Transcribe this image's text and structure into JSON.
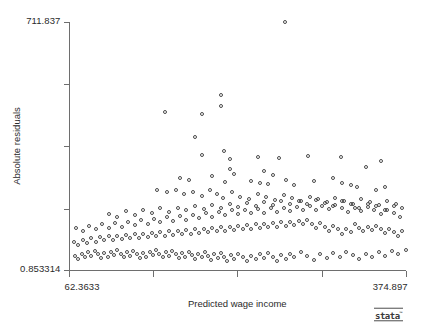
{
  "chart_data": {
    "type": "scatter",
    "title": "",
    "xlabel": "Predicted wage income",
    "ylabel": "Absolute residuals",
    "xlim": [
      62.3633,
      374.897
    ],
    "ylim": [
      0.853314,
      711.837
    ],
    "xticklabels": [
      "62.3633",
      "",
      "",
      "",
      "374.897"
    ],
    "yticklabels": [
      "711.837",
      "",
      "",
      "",
      "0.853314"
    ],
    "xtickvalues": [
      62.3633,
      140.497,
      218.63,
      296.764,
      374.897
    ],
    "ytickvalues": [
      711.837,
      533.591,
      355.345,
      177.099,
      0.853314
    ],
    "grid": false,
    "legend": null,
    "marker": "open-circle",
    "marker_color": "#4a4a4a",
    "annotations": [
      "Stata logo bottom-right"
    ],
    "points": [
      [
        263.0,
        711.8
      ],
      [
        152.0,
        452.0
      ],
      [
        186.0,
        446.0
      ],
      [
        204.0,
        500.0
      ],
      [
        204.0,
        470.0
      ],
      [
        180.0,
        380.0
      ],
      [
        207.0,
        340.0
      ],
      [
        186.0,
        330.0
      ],
      [
        212.0,
        318.0
      ],
      [
        238.0,
        324.0
      ],
      [
        258.0,
        320.0
      ],
      [
        285.0,
        325.0
      ],
      [
        315.0,
        322.0
      ],
      [
        338.0,
        296.0
      ],
      [
        352.0,
        312.0
      ],
      [
        212.0,
        290.0
      ],
      [
        216.0,
        276.0
      ],
      [
        244.0,
        282.0
      ],
      [
        252.0,
        272.0
      ],
      [
        196.0,
        268.0
      ],
      [
        166.0,
        262.0
      ],
      [
        174.0,
        258.0
      ],
      [
        208.0,
        252.0
      ],
      [
        232.0,
        256.0
      ],
      [
        240.0,
        250.0
      ],
      [
        248.0,
        246.0
      ],
      [
        264.0,
        258.0
      ],
      [
        272.0,
        244.0
      ],
      [
        290.0,
        254.0
      ],
      [
        308.0,
        262.0
      ],
      [
        316.0,
        248.0
      ],
      [
        324.0,
        242.0
      ],
      [
        330.0,
        236.0
      ],
      [
        348.0,
        230.0
      ],
      [
        356.0,
        238.0
      ],
      [
        145.0,
        228.0
      ],
      [
        154.0,
        222.0
      ],
      [
        162.0,
        230.0
      ],
      [
        170.0,
        216.0
      ],
      [
        178.0,
        224.0
      ],
      [
        186.0,
        212.0
      ],
      [
        194.0,
        228.0
      ],
      [
        200.0,
        218.0
      ],
      [
        206.0,
        206.0
      ],
      [
        214.0,
        222.0
      ],
      [
        222.0,
        210.0
      ],
      [
        230.0,
        204.0
      ],
      [
        238.0,
        216.0
      ],
      [
        246.0,
        208.0
      ],
      [
        254.0,
        200.0
      ],
      [
        262.0,
        214.0
      ],
      [
        270.0,
        206.0
      ],
      [
        278.0,
        198.0
      ],
      [
        286.0,
        210.0
      ],
      [
        294.0,
        202.0
      ],
      [
        302.0,
        194.0
      ],
      [
        310.0,
        206.0
      ],
      [
        318.0,
        198.0
      ],
      [
        326.0,
        190.0
      ],
      [
        334.0,
        202.0
      ],
      [
        342.0,
        194.0
      ],
      [
        350.0,
        186.0
      ],
      [
        358.0,
        198.0
      ],
      [
        366.0,
        190.0
      ],
      [
        100.0,
        160.0
      ],
      [
        108.0,
        152.0
      ],
      [
        116.0,
        168.0
      ],
      [
        124.0,
        158.0
      ],
      [
        132.0,
        170.0
      ],
      [
        140.0,
        162.0
      ],
      [
        148.0,
        176.0
      ],
      [
        156.0,
        166.0
      ],
      [
        164.0,
        178.0
      ],
      [
        172.0,
        170.0
      ],
      [
        180.0,
        182.0
      ],
      [
        188.0,
        174.0
      ],
      [
        196.0,
        186.0
      ],
      [
        204.0,
        176.0
      ],
      [
        212.0,
        188.0
      ],
      [
        220.0,
        180.0
      ],
      [
        228.0,
        192.0
      ],
      [
        236.0,
        182.0
      ],
      [
        244.0,
        194.0
      ],
      [
        252.0,
        186.0
      ],
      [
        260.0,
        196.0
      ],
      [
        268.0,
        188.0
      ],
      [
        276.0,
        198.0
      ],
      [
        284.0,
        190.0
      ],
      [
        292.0,
        200.0
      ],
      [
        300.0,
        192.0
      ],
      [
        308.0,
        184.0
      ],
      [
        316.0,
        196.0
      ],
      [
        324.0,
        188.0
      ],
      [
        332.0,
        178.0
      ],
      [
        340.0,
        190.0
      ],
      [
        348.0,
        182.0
      ],
      [
        356.0,
        172.0
      ],
      [
        364.0,
        184.0
      ],
      [
        372.0,
        176.0
      ],
      [
        70.0,
        120.0
      ],
      [
        76.0,
        112.0
      ],
      [
        82.0,
        126.0
      ],
      [
        88.0,
        116.0
      ],
      [
        94.0,
        130.0
      ],
      [
        100.0,
        120.0
      ],
      [
        106.0,
        134.0
      ],
      [
        112.0,
        124.0
      ],
      [
        118.0,
        138.0
      ],
      [
        124.0,
        128.0
      ],
      [
        130.0,
        142.0
      ],
      [
        136.0,
        132.0
      ],
      [
        142.0,
        146.0
      ],
      [
        148.0,
        136.0
      ],
      [
        154.0,
        150.0
      ],
      [
        160.0,
        140.0
      ],
      [
        166.0,
        154.0
      ],
      [
        172.0,
        144.0
      ],
      [
        178.0,
        158.0
      ],
      [
        184.0,
        148.0
      ],
      [
        190.0,
        162.0
      ],
      [
        196.0,
        152.0
      ],
      [
        202.0,
        166.0
      ],
      [
        208.0,
        156.0
      ],
      [
        214.0,
        170.0
      ],
      [
        220.0,
        160.0
      ],
      [
        226.0,
        172.0
      ],
      [
        232.0,
        162.0
      ],
      [
        238.0,
        174.0
      ],
      [
        244.0,
        164.0
      ],
      [
        250.0,
        176.0
      ],
      [
        256.0,
        166.0
      ],
      [
        262.0,
        178.0
      ],
      [
        268.0,
        168.0
      ],
      [
        274.0,
        180.0
      ],
      [
        280.0,
        170.0
      ],
      [
        286.0,
        182.0
      ],
      [
        292.0,
        172.0
      ],
      [
        298.0,
        184.0
      ],
      [
        304.0,
        174.0
      ],
      [
        310.0,
        186.0
      ],
      [
        316.0,
        176.0
      ],
      [
        322.0,
        166.0
      ],
      [
        328.0,
        178.0
      ],
      [
        334.0,
        168.0
      ],
      [
        340.0,
        180.0
      ],
      [
        346.0,
        170.0
      ],
      [
        352.0,
        160.0
      ],
      [
        358.0,
        172.0
      ],
      [
        364.0,
        162.0
      ],
      [
        370.0,
        150.0
      ],
      [
        68.0,
        80.0
      ],
      [
        72.0,
        70.0
      ],
      [
        76.0,
        86.0
      ],
      [
        80.0,
        76.0
      ],
      [
        84.0,
        90.0
      ],
      [
        88.0,
        80.0
      ],
      [
        92.0,
        94.0
      ],
      [
        96.0,
        84.0
      ],
      [
        100.0,
        96.0
      ],
      [
        104.0,
        86.0
      ],
      [
        108.0,
        98.0
      ],
      [
        112.0,
        88.0
      ],
      [
        116.0,
        100.0
      ],
      [
        120.0,
        90.0
      ],
      [
        124.0,
        102.0
      ],
      [
        128.0,
        92.0
      ],
      [
        132.0,
        104.0
      ],
      [
        136.0,
        94.0
      ],
      [
        140.0,
        106.0
      ],
      [
        144.0,
        96.0
      ],
      [
        148.0,
        108.0
      ],
      [
        152.0,
        98.0
      ],
      [
        156.0,
        110.0
      ],
      [
        160.0,
        100.0
      ],
      [
        164.0,
        112.0
      ],
      [
        168.0,
        102.0
      ],
      [
        172.0,
        114.0
      ],
      [
        176.0,
        104.0
      ],
      [
        180.0,
        116.0
      ],
      [
        184.0,
        106.0
      ],
      [
        188.0,
        118.0
      ],
      [
        192.0,
        108.0
      ],
      [
        196.0,
        120.0
      ],
      [
        200.0,
        110.0
      ],
      [
        204.0,
        122.0
      ],
      [
        208.0,
        112.0
      ],
      [
        212.0,
        124.0
      ],
      [
        216.0,
        114.0
      ],
      [
        220.0,
        126.0
      ],
      [
        224.0,
        116.0
      ],
      [
        228.0,
        128.0
      ],
      [
        232.0,
        118.0
      ],
      [
        236.0,
        130.0
      ],
      [
        240.0,
        120.0
      ],
      [
        244.0,
        132.0
      ],
      [
        248.0,
        122.0
      ],
      [
        252.0,
        134.0
      ],
      [
        256.0,
        124.0
      ],
      [
        260.0,
        136.0
      ],
      [
        264.0,
        126.0
      ],
      [
        268.0,
        138.0
      ],
      [
        272.0,
        128.0
      ],
      [
        276.0,
        140.0
      ],
      [
        280.0,
        130.0
      ],
      [
        284.0,
        142.0
      ],
      [
        288.0,
        132.0
      ],
      [
        292.0,
        120.0
      ],
      [
        296.0,
        134.0
      ],
      [
        300.0,
        124.0
      ],
      [
        304.0,
        112.0
      ],
      [
        308.0,
        126.0
      ],
      [
        312.0,
        116.0
      ],
      [
        316.0,
        104.0
      ],
      [
        320.0,
        118.0
      ],
      [
        324.0,
        108.0
      ],
      [
        328.0,
        130.0
      ],
      [
        332.0,
        120.0
      ],
      [
        336.0,
        110.0
      ],
      [
        340.0,
        124.0
      ],
      [
        344.0,
        114.0
      ],
      [
        348.0,
        126.0
      ],
      [
        352.0,
        116.0
      ],
      [
        356.0,
        106.0
      ],
      [
        360.0,
        118.0
      ],
      [
        364.0,
        108.0
      ],
      [
        368.0,
        96.0
      ],
      [
        372.0,
        110.0
      ],
      [
        69.0,
        40.0
      ],
      [
        72.0,
        30.0
      ],
      [
        75.0,
        46.0
      ],
      [
        78.0,
        36.0
      ],
      [
        81.0,
        50.0
      ],
      [
        84.0,
        40.0
      ],
      [
        87.0,
        54.0
      ],
      [
        90.0,
        44.0
      ],
      [
        93.0,
        34.0
      ],
      [
        96.0,
        48.0
      ],
      [
        99.0,
        38.0
      ],
      [
        102.0,
        52.0
      ],
      [
        105.0,
        42.0
      ],
      [
        108.0,
        56.0
      ],
      [
        111.0,
        46.0
      ],
      [
        114.0,
        36.0
      ],
      [
        117.0,
        50.0
      ],
      [
        120.0,
        40.0
      ],
      [
        123.0,
        54.0
      ],
      [
        126.0,
        44.0
      ],
      [
        129.0,
        34.0
      ],
      [
        132.0,
        48.0
      ],
      [
        135.0,
        38.0
      ],
      [
        138.0,
        52.0
      ],
      [
        141.0,
        42.0
      ],
      [
        144.0,
        56.0
      ],
      [
        147.0,
        46.0
      ],
      [
        150.0,
        36.0
      ],
      [
        153.0,
        50.0
      ],
      [
        156.0,
        40.0
      ],
      [
        159.0,
        54.0
      ],
      [
        162.0,
        44.0
      ],
      [
        165.0,
        34.0
      ],
      [
        168.0,
        48.0
      ],
      [
        171.0,
        38.0
      ],
      [
        174.0,
        52.0
      ],
      [
        177.0,
        42.0
      ],
      [
        180.0,
        30.0
      ],
      [
        183.0,
        46.0
      ],
      [
        186.0,
        36.0
      ],
      [
        189.0,
        50.0
      ],
      [
        192.0,
        40.0
      ],
      [
        195.0,
        28.0
      ],
      [
        198.0,
        44.0
      ],
      [
        201.0,
        34.0
      ],
      [
        204.0,
        48.0
      ],
      [
        207.0,
        38.0
      ],
      [
        210.0,
        26.0
      ],
      [
        213.0,
        42.0
      ],
      [
        216.0,
        32.0
      ],
      [
        220.0,
        46.0
      ],
      [
        224.0,
        36.0
      ],
      [
        228.0,
        24.0
      ],
      [
        232.0,
        40.0
      ],
      [
        236.0,
        30.0
      ],
      [
        240.0,
        44.0
      ],
      [
        244.0,
        34.0
      ],
      [
        248.0,
        48.0
      ],
      [
        252.0,
        38.0
      ],
      [
        256.0,
        26.0
      ],
      [
        260.0,
        42.0
      ],
      [
        264.0,
        32.0
      ],
      [
        268.0,
        46.0
      ],
      [
        272.0,
        36.0
      ],
      [
        278.0,
        50.0
      ],
      [
        284.0,
        40.0
      ],
      [
        290.0,
        28.0
      ],
      [
        296.0,
        44.0
      ],
      [
        302.0,
        34.0
      ],
      [
        308.0,
        48.0
      ],
      [
        314.0,
        38.0
      ],
      [
        320.0,
        52.0
      ],
      [
        326.0,
        42.0
      ],
      [
        332.0,
        30.0
      ],
      [
        338.0,
        46.0
      ],
      [
        344.0,
        36.0
      ],
      [
        350.0,
        50.0
      ],
      [
        356.0,
        40.0
      ],
      [
        362.0,
        54.0
      ],
      [
        368.0,
        44.0
      ],
      [
        374.897,
        58.0
      ]
    ]
  },
  "branding": {
    "logo_text": "stata",
    "logo_tm": "™"
  }
}
